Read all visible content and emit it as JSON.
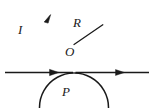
{
  "figure": {
    "kind": "physics-diagram",
    "canvas": {
      "width": 154,
      "height": 108
    },
    "stroke_color": "#1a1a1a",
    "background_color": "#ffffff",
    "labels": {
      "current": "I",
      "radius": "R",
      "center": "O",
      "tangent_point": "P"
    },
    "geometry": {
      "circle": {
        "cx": 74,
        "cy": 38.5,
        "r": 34.5
      },
      "wire": {
        "y": 72.5,
        "x_start": 5,
        "x_end": 149
      },
      "radius_line": {
        "x1": 74,
        "y1": 44,
        "x2": 102.5,
        "y2": 25
      },
      "loop_arrow_at": {
        "x": 47.5,
        "y": 17
      },
      "wire_arrow_left_at": {
        "x": 56,
        "y": 72.5
      },
      "wire_arrow_right_at": {
        "x": 122,
        "y": 72.5
      }
    }
  }
}
